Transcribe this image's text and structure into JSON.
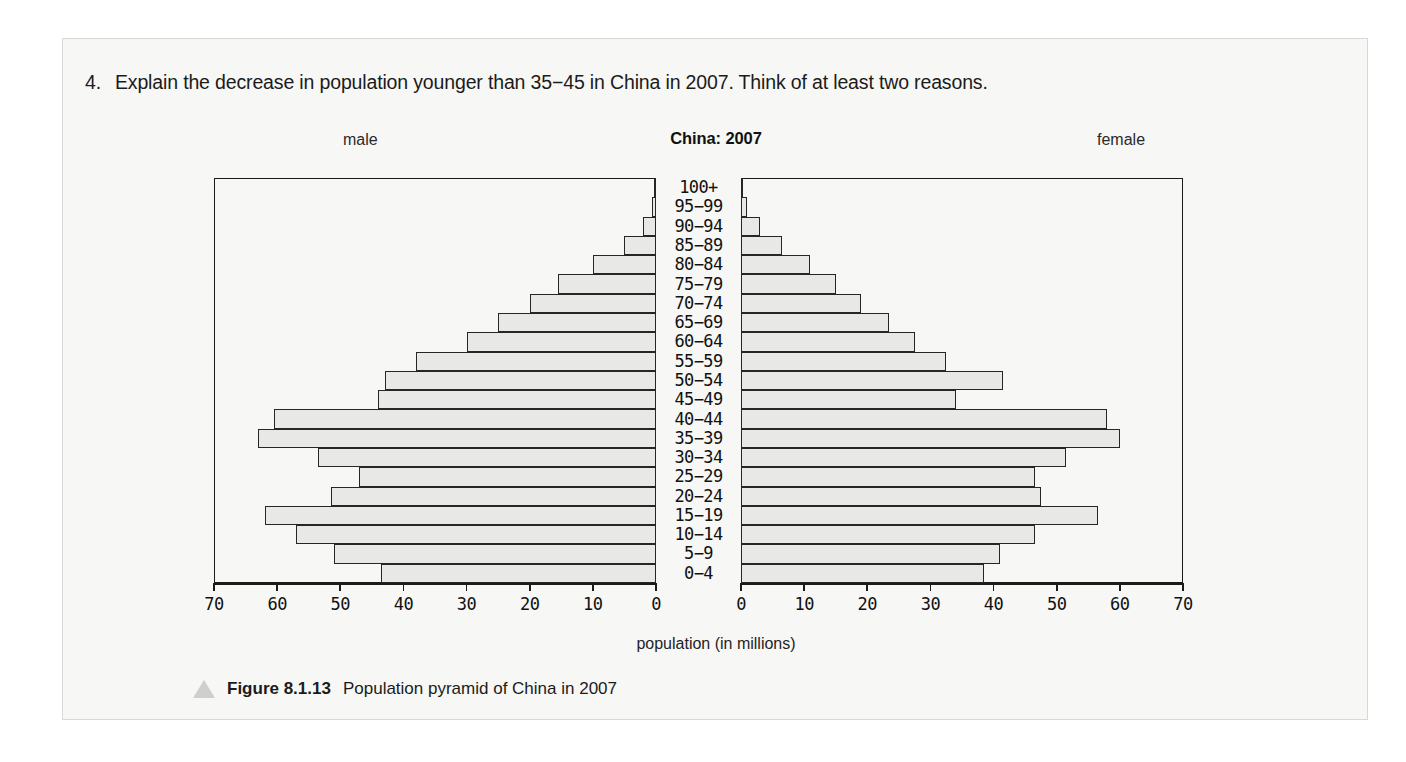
{
  "question": {
    "number": "4.",
    "text": "Explain the decrease in population younger than 35−45 in China in 2007. Think of at least two reasons."
  },
  "chart": {
    "title": "China: 2007",
    "left_label": "male",
    "right_label": "female",
    "xaxis_title": "population (in millions)"
  },
  "caption": {
    "figure_number": "Figure 8.1.13",
    "figure_text": "Population pyramid of China in 2007",
    "marker_icon": "triangle-icon"
  },
  "chart_data": {
    "type": "bar",
    "subtype": "population-pyramid",
    "title": "China: 2007",
    "xlabel": "population (in millions)",
    "ylabel": "",
    "xlim": [
      0,
      70
    ],
    "grid": false,
    "legend_position": "outside-top-left-and-right",
    "tick_values": [
      70,
      60,
      50,
      40,
      30,
      20,
      10,
      0
    ],
    "tick_labels_left": [
      "70",
      "60",
      "50",
      "40",
      "30",
      "20",
      "10",
      "0"
    ],
    "tick_labels_right": [
      "0",
      "10",
      "20",
      "30",
      "40",
      "50",
      "60",
      "70"
    ],
    "categories": [
      "100+",
      "95−99",
      "90−94",
      "85−89",
      "80−84",
      "75−79",
      "70−74",
      "65−69",
      "60−64",
      "55−59",
      "50−54",
      "45−49",
      "40−44",
      "35−39",
      "30−34",
      "25−29",
      "20−24",
      "15−19",
      "10−14",
      "5−9",
      "0−4"
    ],
    "series": [
      {
        "name": "male",
        "side": "left",
        "values": [
          0.1,
          0.6,
          2.0,
          5.0,
          10.0,
          15.5,
          20.0,
          25.0,
          30.0,
          38.0,
          43.0,
          44.0,
          60.5,
          63.0,
          53.5,
          47.0,
          51.5,
          62.0,
          57.0,
          51.0,
          43.5
        ]
      },
      {
        "name": "female",
        "side": "right",
        "values": [
          0.2,
          1.0,
          3.0,
          6.5,
          11.0,
          15.0,
          19.0,
          23.5,
          27.5,
          32.5,
          41.5,
          34.0,
          58.0,
          60.0,
          51.5,
          46.5,
          47.5,
          56.5,
          46.5,
          41.0,
          38.5
        ]
      }
    ]
  },
  "colors": {
    "bar_fill": "#e8e8e6",
    "bar_stroke": "#262626",
    "page_bg": "#f7f7f5",
    "text": "#1b1b1b"
  }
}
